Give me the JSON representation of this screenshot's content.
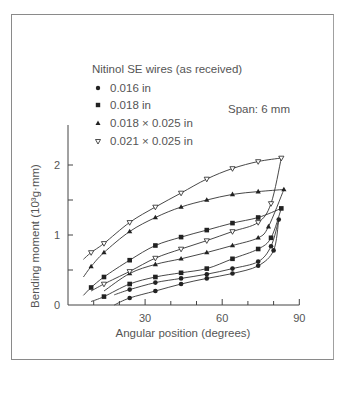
{
  "chart_data": {
    "type": "line",
    "title": "Nitinol SE wires (as received)",
    "annotation": "Span: 6 mm",
    "xlabel": "Angular position (degrees)",
    "ylabel": "Bending moment (10³g·mm)",
    "xlim": [
      0,
      90
    ],
    "ylim": [
      0,
      2.5
    ],
    "x_ticks": [
      "30",
      "60",
      "90"
    ],
    "y_ticks": [
      "0",
      "1",
      "2"
    ],
    "grid": false,
    "legend_position": "top-left",
    "series": [
      {
        "name": "0.016 in",
        "marker": "circle",
        "loading": {
          "x": [
            24,
            34,
            44,
            54,
            64,
            74,
            79,
            82
          ],
          "y": [
            0.22,
            0.32,
            0.38,
            0.44,
            0.52,
            0.62,
            0.84,
            1.22
          ]
        },
        "unloading": {
          "x": [
            82,
            80,
            74,
            64,
            54,
            44,
            34,
            24,
            18
          ],
          "y": [
            1.22,
            0.78,
            0.56,
            0.45,
            0.38,
            0.3,
            0.2,
            0.1,
            0.0
          ]
        }
      },
      {
        "name": "0.018 in",
        "marker": "square",
        "loading": {
          "x": [
            9,
            14,
            24,
            34,
            44,
            54,
            64,
            74,
            83
          ],
          "y": [
            0.25,
            0.4,
            0.64,
            0.85,
            0.97,
            1.07,
            1.17,
            1.25,
            1.38
          ]
        },
        "unloading": {
          "x": [
            83,
            79,
            74,
            64,
            54,
            44,
            34,
            24,
            14,
            9
          ],
          "y": [
            1.38,
            0.96,
            0.8,
            0.66,
            0.52,
            0.46,
            0.4,
            0.3,
            0.12,
            0.05
          ]
        }
      },
      {
        "name": "0.018 × 0.025 in",
        "marker": "triangle-up",
        "loading": {
          "x": [
            9,
            14,
            24,
            34,
            44,
            54,
            64,
            74,
            84
          ],
          "y": [
            0.55,
            0.75,
            1.05,
            1.25,
            1.4,
            1.5,
            1.58,
            1.62,
            1.65
          ]
        },
        "unloading": {
          "x": [
            84,
            78,
            74,
            64,
            54,
            44,
            34,
            24,
            14
          ],
          "y": [
            1.65,
            1.12,
            0.96,
            0.85,
            0.75,
            0.66,
            0.58,
            0.45,
            0.2
          ]
        }
      },
      {
        "name": "0.021 × 0.025 in",
        "marker": "triangle-down-open",
        "loading": {
          "x": [
            9,
            14,
            24,
            34,
            44,
            54,
            64,
            74,
            83
          ],
          "y": [
            0.75,
            0.88,
            1.18,
            1.4,
            1.6,
            1.8,
            1.95,
            2.05,
            2.1
          ]
        },
        "unloading": {
          "x": [
            83,
            79,
            74,
            64,
            54,
            44,
            34,
            24,
            14,
            9
          ],
          "y": [
            2.1,
            1.45,
            1.18,
            1.05,
            0.92,
            0.8,
            0.67,
            0.48,
            0.3,
            0.2
          ]
        }
      }
    ]
  },
  "legend": {
    "title": "Nitinol SE wires (as received)",
    "items": [
      {
        "label": "0.016 in",
        "marker": "circle"
      },
      {
        "label": "0.018 in",
        "marker": "square"
      },
      {
        "label": "0.018 × 0.025 in",
        "marker": "triangle-up"
      },
      {
        "label": "0.021 × 0.025 in",
        "marker": "triangle-down-open"
      }
    ]
  },
  "axes": {
    "xlabel": "Angular position (degrees)",
    "ylabel": "Bending moment (10³g·mm)",
    "x_tick_labels": [
      "30",
      "60",
      "90"
    ],
    "y_tick_labels": [
      "0",
      "1",
      "2"
    ]
  },
  "annotation": "Span: 6 mm",
  "colors": {
    "ink": "#333333",
    "text": "#555555",
    "frame": "#8a8a8a"
  }
}
